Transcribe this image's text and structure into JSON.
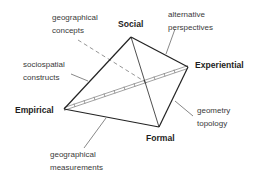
{
  "diagram": {
    "type": "tetrahedron",
    "vertices": [
      {
        "id": "social",
        "label": "Social",
        "x": 131,
        "y": 37
      },
      {
        "id": "experiential",
        "label": "Experiential",
        "x": 188,
        "y": 67
      },
      {
        "id": "formal",
        "label": "Formal",
        "x": 159,
        "y": 127
      },
      {
        "id": "empirical",
        "label": "Empirical",
        "x": 64,
        "y": 109
      }
    ],
    "edge_annotations": [
      {
        "id": "geographical-concepts",
        "lines": [
          "geographical",
          "concepts"
        ],
        "edge": "social-hidden-dashed"
      },
      {
        "id": "alternative-perspectives",
        "lines": [
          "alternative",
          "perspectives"
        ],
        "edge": "social-experiential"
      },
      {
        "id": "sociospatial-constructs",
        "lines": [
          "sociospatial",
          "constructs"
        ],
        "edge": "empirical-social"
      },
      {
        "id": "geometry-topology",
        "lines": [
          "geometry",
          "topology"
        ],
        "edge": "experiential-formal"
      },
      {
        "id": "geographical-measurements",
        "lines": [
          "geographical",
          "measurements"
        ],
        "edge": "empirical-formal"
      }
    ],
    "colors": {
      "edge": "#222222",
      "leader": "#555555",
      "dashed": "#8a8a8a",
      "hatched": "#7a7a7a",
      "text": "#3a3a3a"
    }
  }
}
